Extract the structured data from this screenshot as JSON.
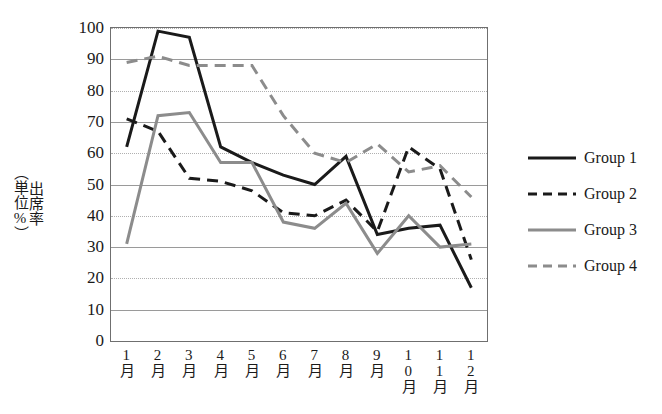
{
  "chart_data": {
    "type": "line",
    "title": "",
    "xlabel": "",
    "ylabel": "出席率（単位%）",
    "ylabel_line1": "出席率",
    "ylabel_line2": "（単位%）",
    "categories": [
      "1月",
      "2月",
      "3月",
      "4月",
      "5月",
      "6月",
      "7月",
      "8月",
      "9月",
      "10月",
      "11月",
      "12月"
    ],
    "yticks": [
      0,
      10,
      20,
      30,
      40,
      50,
      60,
      70,
      80,
      90,
      100
    ],
    "ylim": [
      0,
      100
    ],
    "grid": true,
    "legend_position": "right",
    "series": [
      {
        "name": "Group 1",
        "color": "#1a1a1a",
        "style": "solid",
        "width": 3,
        "values": [
          62,
          99,
          97,
          62,
          57,
          53,
          50,
          59,
          34,
          36,
          37,
          17
        ]
      },
      {
        "name": "Group 2",
        "color": "#1a1a1a",
        "style": "dashed",
        "width": 3,
        "values": [
          71,
          67,
          52,
          51,
          48,
          41,
          40,
          45,
          35,
          62,
          55,
          26
        ]
      },
      {
        "name": "Group 3",
        "color": "#8c8c8c",
        "style": "solid",
        "width": 3,
        "values": [
          31,
          72,
          73,
          57,
          57,
          38,
          36,
          44,
          28,
          40,
          30,
          31
        ]
      },
      {
        "name": "Group 4",
        "color": "#8c8c8c",
        "style": "dashed",
        "width": 3,
        "values": [
          89,
          91,
          88,
          88,
          88,
          72,
          60,
          57,
          63,
          54,
          56,
          46
        ]
      }
    ]
  },
  "legend": {
    "items": [
      {
        "label": "Group 1"
      },
      {
        "label": "Group 2"
      },
      {
        "label": "Group 3"
      },
      {
        "label": "Group 4"
      }
    ]
  }
}
